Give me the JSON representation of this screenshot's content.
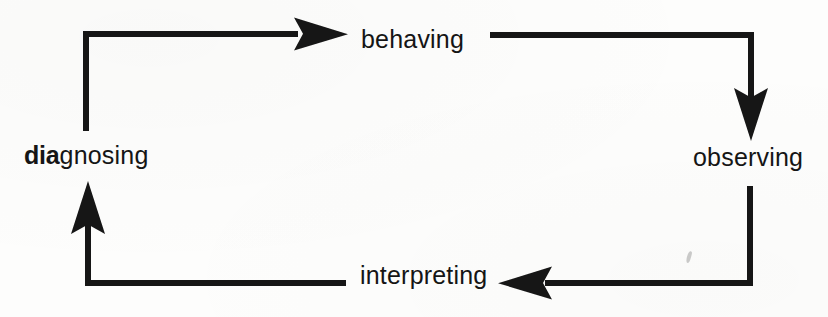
{
  "diagram": {
    "type": "cycle",
    "title": "",
    "background_color": "#fdfdfc",
    "ink_color": "#151515",
    "nodes": [
      {
        "id": "behaving",
        "label": "behaving",
        "position": "top",
        "emphasis": "none"
      },
      {
        "id": "observing",
        "label": "observing",
        "position": "right",
        "emphasis": "none"
      },
      {
        "id": "interpreting",
        "label": "interpreting",
        "position": "bottom",
        "emphasis": "none"
      },
      {
        "id": "diagnosing",
        "label": "diagnosing",
        "label_bold_prefix": "dia",
        "label_plain_suffix": "gnosing",
        "position": "left",
        "emphasis": "partial-bold"
      }
    ],
    "edges": [
      {
        "id": "diagnosing-to-behaving",
        "from": "diagnosing",
        "to": "behaving",
        "arrowhead": "right",
        "style": "elbow"
      },
      {
        "id": "behaving-to-observing",
        "from": "behaving",
        "to": "observing",
        "arrowhead": "down",
        "style": "elbow"
      },
      {
        "id": "observing-to-interpreting",
        "from": "observing",
        "to": "interpreting",
        "arrowhead": "left",
        "style": "elbow"
      },
      {
        "id": "interpreting-to-diagnosing",
        "from": "interpreting",
        "to": "diagnosing",
        "arrowhead": "up",
        "style": "elbow"
      }
    ],
    "artifacts": [
      {
        "id": "scan-speck",
        "kind": "scan-speck"
      }
    ]
  }
}
